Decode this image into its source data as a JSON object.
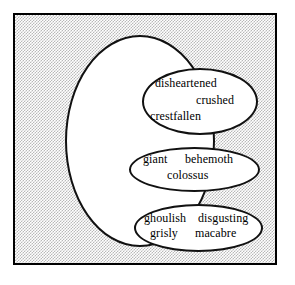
{
  "diagram": {
    "type": "nested-set-diagram",
    "background_pattern": "gray-stipple",
    "frame_color": "#000000",
    "ellipse_fill": "#ffffff",
    "ellipse_stroke": "#111111",
    "outer_set": {
      "name": "outer-ellipse",
      "label": ""
    },
    "groups": [
      {
        "name": "group-disheartened",
        "words": [
          {
            "text": "disheartened"
          },
          {
            "text": "crushed"
          },
          {
            "text": "crestfallen"
          }
        ]
      },
      {
        "name": "group-giant",
        "words": [
          {
            "text": "giant"
          },
          {
            "text": "behemoth"
          },
          {
            "text": "colossus"
          }
        ]
      },
      {
        "name": "group-ghoulish",
        "words": [
          {
            "text": "ghoulish"
          },
          {
            "text": "disgusting"
          },
          {
            "text": "grisly"
          },
          {
            "text": "macabre"
          }
        ]
      }
    ]
  }
}
